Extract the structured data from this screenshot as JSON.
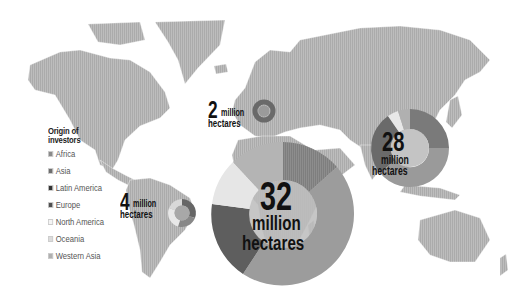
{
  "legend": {
    "title_line1": "Origin of",
    "title_line2": "investors",
    "items": [
      {
        "label": "Africa",
        "color": "#8a8a8a"
      },
      {
        "label": "Asia",
        "color": "#6e6e6e"
      },
      {
        "label": "Latin America",
        "color": "#333333"
      },
      {
        "label": "Europe",
        "color": "#4f4f4f"
      },
      {
        "label": "North America",
        "color": "#f4f4f4"
      },
      {
        "label": "Oceania",
        "color": "#dcdcdc"
      },
      {
        "label": "Western Asia",
        "color": "#b0b0b0"
      }
    ]
  },
  "regions": [
    {
      "name": "Europe",
      "number": "2",
      "unit_line1": "million",
      "unit_line2": "hectares"
    },
    {
      "name": "Latin America",
      "number": "4",
      "unit_line1": "million",
      "unit_line2": "hectares"
    },
    {
      "name": "Africa",
      "number": "32",
      "unit_line1": "million",
      "unit_line2": "hectares"
    },
    {
      "name": "Asia",
      "number": "28",
      "unit_line1": "million",
      "unit_line2": "hectares"
    }
  ]
}
